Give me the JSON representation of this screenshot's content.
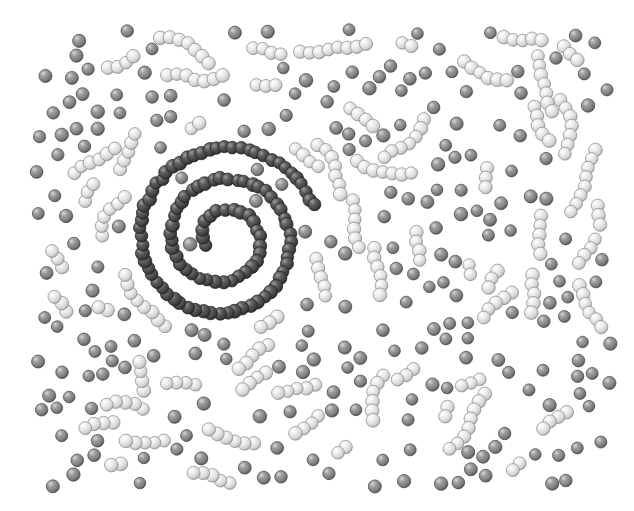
{
  "figure": {
    "title": "Spiral-templated colloidal assembly snapshot",
    "background_color": "#ffffff",
    "width": 634,
    "height": 511,
    "content_box": {
      "x": 40,
      "y": 34,
      "width": 566,
      "height": 448
    }
  },
  "palette": {
    "template_dark": "#4b4b4b",
    "template_dark_shadow": "#2e2e2e",
    "template_dark_highlight": "#8a8a8a",
    "monomer_gray": "#8d8d8d",
    "monomer_gray_shadow": "#5e5e5e",
    "monomer_gray_highlight": "#c8c8c8",
    "chain_light": "#e2e2e2",
    "chain_light_shadow": "#a9a9a9",
    "chain_light_highlight": "#ffffff",
    "outline": "#3a3a3a"
  },
  "species": [
    {
      "id": "template",
      "label": "Spiral template bead",
      "color": "#4b4b4b",
      "radius_px": 6.6,
      "count_hint": 300
    },
    {
      "id": "monomer",
      "label": "Free gray monomer",
      "color": "#8d8d8d",
      "radius_px": 6.4,
      "count_hint": 230
    },
    {
      "id": "chainbead",
      "label": "Light chain bead",
      "color": "#e2e2e2",
      "radius_px": 6.6,
      "count_hint": 320
    }
  ],
  "chart_data": {
    "type": "scatter",
    "title": "Spiral-templated colloidal assembly snapshot",
    "xlabel": "",
    "ylabel": "",
    "xlim": [
      40,
      606
    ],
    "ylim": [
      34,
      482
    ],
    "grid": false,
    "legend": "none",
    "spiral": {
      "kind": "archimedean",
      "center_x": 223,
      "center_y": 238,
      "a_px": 6,
      "b_px": 30.5,
      "theta_start_deg": 160,
      "theta_end_deg": 1065,
      "turns": 2.5,
      "bead_spacing_px": 8.0,
      "bead_radius_px": 6.6,
      "jitter_px": 1.5,
      "color": "#4b4b4b"
    },
    "monomers": {
      "description": "Isolated medium-gray spheres filling the inter-arm gaps",
      "radius_px": 6.4,
      "color": "#8d8d8d",
      "density_per_10kpx2": 9.0
    },
    "light_chains": {
      "description": "Short chains (2-8 beads) of light spheres, tangentially aligned near spiral arms",
      "bead_radius_px": 6.6,
      "bead_spacing_px": 9.6,
      "color": "#e2e2e2",
      "length_range": [
        2,
        8
      ],
      "chain_count_hint": 62
    }
  },
  "render": {
    "seed": 20240517,
    "sphere_shading": "radial-gradient",
    "highlight_offset": [
      -0.3,
      -0.35
    ]
  }
}
